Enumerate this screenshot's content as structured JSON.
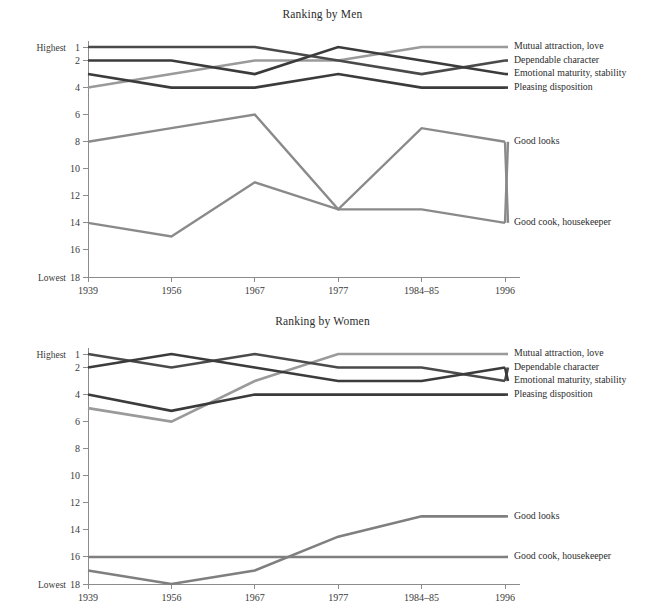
{
  "figure": {
    "background": "#ffffff",
    "axis_color": "#8c8c8c",
    "text_color": "#2c2c2c"
  },
  "axis": {
    "y_high_prefix": "Highest",
    "y_low_prefix": "Lowest",
    "y_ticks": [
      "1",
      "2",
      "4",
      "6",
      "8",
      "10",
      "12",
      "14",
      "16",
      "18"
    ],
    "y_tick_values": [
      1,
      2,
      4,
      6,
      8,
      10,
      12,
      14,
      16,
      18
    ],
    "x_ticks": [
      "1939",
      "1956",
      "1967",
      "1977",
      "1984–85",
      "1996"
    ]
  },
  "charts": [
    {
      "id": "ranking-by-men",
      "title": "Ranking by Men"
    },
    {
      "id": "ranking-by-women",
      "title": "Ranking by Women"
    }
  ],
  "chart_data": [
    {
      "type": "line",
      "title": "Ranking by Men",
      "xlabel": "",
      "ylabel": "",
      "categories": [
        "1939",
        "1956",
        "1967",
        "1977",
        "1984–85",
        "1996"
      ],
      "ylim": [
        1,
        18
      ],
      "y_inverted": true,
      "y_axis_note": "1 = Highest rank, 18 = Lowest rank",
      "grid": false,
      "legend": "right-end-labels",
      "series": [
        {
          "name": "Mutual attraction, love",
          "values": [
            4,
            3,
            2,
            2,
            1,
            1
          ],
          "color": "#9a9a9a",
          "width": 2.6,
          "label_y": 1
        },
        {
          "name": "Dependable character",
          "values": [
            1,
            1,
            1,
            2,
            3,
            2
          ],
          "color": "#4a4a4a",
          "width": 2.6,
          "label_y": 2
        },
        {
          "name": "Emotional maturity, stability",
          "values": [
            2,
            2,
            3,
            1,
            2,
            3
          ],
          "color": "#3b3b3b",
          "width": 2.6,
          "label_y": 3
        },
        {
          "name": "Pleasing disposition",
          "values": [
            3,
            4,
            4,
            3,
            4,
            4
          ],
          "color": "#3b3b3b",
          "width": 2.6,
          "label_y": 4
        },
        {
          "name": "Good looks",
          "values": [
            14,
            15,
            11,
            13,
            13,
            14
          ],
          "color": "#8a8a8a",
          "width": 2.4,
          "label_y": 8
        },
        {
          "name": "Good cook, housekeeper",
          "values": [
            8,
            7,
            6,
            13,
            7,
            8
          ],
          "color": "#8a8a8a",
          "width": 2.4,
          "label_y": 14
        }
      ],
      "series_label_order": [
        "Mutual attraction, love",
        "Dependable character",
        "Emotional maturity, stability",
        "Pleasing disposition",
        "Good looks",
        "Good cook, housekeeper"
      ]
    },
    {
      "type": "line",
      "title": "Ranking by Women",
      "xlabel": "",
      "ylabel": "",
      "categories": [
        "1939",
        "1956",
        "1967",
        "1977",
        "1984–85",
        "1996"
      ],
      "ylim": [
        1,
        18
      ],
      "y_inverted": true,
      "y_axis_note": "1 = Highest rank, 18 = Lowest rank",
      "grid": false,
      "legend": "right-end-labels",
      "series": [
        {
          "name": "Mutual attraction, love",
          "values": [
            5,
            6,
            3,
            1,
            1,
            1
          ],
          "color": "#9a9a9a",
          "width": 2.6,
          "label_y": 1
        },
        {
          "name": "Dependable character",
          "values": [
            1,
            2,
            1,
            2,
            2,
            3
          ],
          "color": "#4a4a4a",
          "width": 2.6,
          "label_y": 2
        },
        {
          "name": "Emotional maturity, stability",
          "values": [
            2,
            1,
            2,
            3,
            3,
            2
          ],
          "color": "#3b3b3b",
          "width": 2.6,
          "label_y": 3
        },
        {
          "name": "Pleasing disposition",
          "values": [
            4,
            5.2,
            4,
            4,
            4,
            4
          ],
          "color": "#3b3b3b",
          "width": 2.6,
          "label_y": 4
        },
        {
          "name": "Good looks",
          "values": [
            17,
            18,
            17,
            14.5,
            13,
            13
          ],
          "color": "#7f7f7f",
          "width": 2.6,
          "label_y": 13
        },
        {
          "name": "Good cook, housekeeper",
          "values": [
            16,
            16,
            16,
            16,
            16,
            16
          ],
          "color": "#7f7f7f",
          "width": 2.6,
          "label_y": 16
        }
      ],
      "series_label_order": [
        "Mutual attraction, love",
        "Dependable character",
        "Emotional maturity, stability",
        "Pleasing disposition",
        "Good looks",
        "Good cook, housekeeper"
      ]
    }
  ]
}
